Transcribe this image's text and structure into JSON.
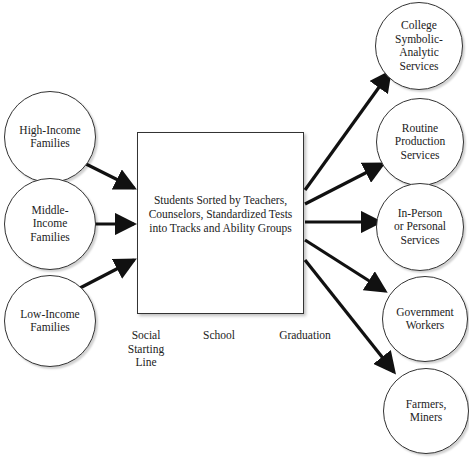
{
  "diagram": {
    "sources": [
      {
        "id": "high",
        "label": "High-Income\nFamilies"
      },
      {
        "id": "middle",
        "label": "Middle-\nIncome\nFamilies"
      },
      {
        "id": "low",
        "label": "Low-Income\nFamilies"
      }
    ],
    "process": {
      "label": "Students Sorted by Teachers,\nCounselors, Standardized Tests\ninto Tracks and Ability Groups"
    },
    "outcomes": [
      {
        "id": "college",
        "label": "College\nSymbolic-\nAnalytic\nServices"
      },
      {
        "id": "routine",
        "label": "Routine\nProduction\nServices"
      },
      {
        "id": "inperson",
        "label": "In-Person\nor Personal\nServices"
      },
      {
        "id": "government",
        "label": "Government\nWorkers"
      },
      {
        "id": "farmers",
        "label": "Farmers,\nMiners"
      }
    ],
    "stages": [
      {
        "label": "Social\nStarting\nLine"
      },
      {
        "label": "School"
      },
      {
        "label": "Graduation"
      }
    ],
    "colors": {
      "stroke": "#111111",
      "background": "#ffffff"
    }
  }
}
